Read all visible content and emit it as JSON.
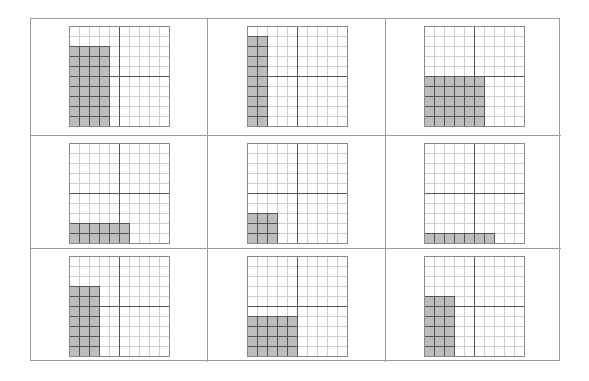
{
  "layout": {
    "rows": 3,
    "cols": 3,
    "grid_size": 10
  },
  "colors": {
    "shade": "#bdbdbd",
    "thin_line": "#cfcfcf",
    "shade_line": "#555555",
    "outer_line": "#8a8a8a",
    "mid_line": "#555555"
  },
  "grids": [
    {
      "id": 1,
      "shaded_cols": 4,
      "shaded_rows": 8,
      "label": "4 x 8"
    },
    {
      "id": 2,
      "shaded_cols": 2,
      "shaded_rows": 9,
      "label": "2 x 9"
    },
    {
      "id": 3,
      "shaded_cols": 6,
      "shaded_rows": 5,
      "label": "6 x 5"
    },
    {
      "id": 4,
      "shaded_cols": 6,
      "shaded_rows": 2,
      "label": "6 x 2"
    },
    {
      "id": 5,
      "shaded_cols": 3,
      "shaded_rows": 3,
      "label": "3 x 3"
    },
    {
      "id": 6,
      "shaded_cols": 7,
      "shaded_rows": 1,
      "label": "7 x 1"
    },
    {
      "id": 7,
      "shaded_cols": 3,
      "shaded_rows": 7,
      "label": "3 x 7"
    },
    {
      "id": 8,
      "shaded_cols": 5,
      "shaded_rows": 4,
      "label": "5 x 4"
    },
    {
      "id": 9,
      "shaded_cols": 3,
      "shaded_rows": 6,
      "label": "3 x 6"
    }
  ]
}
